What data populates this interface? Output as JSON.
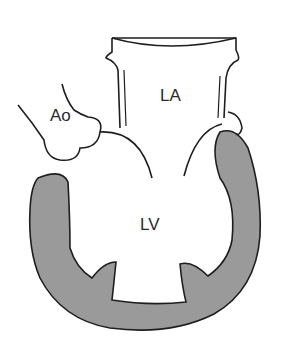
{
  "diagram": {
    "labels": {
      "aorta": "Ao",
      "left_atrium": "LA",
      "left_ventricle": "LV"
    },
    "colors": {
      "myocardium": "#9a9a9a",
      "outline": "#1e1e1e",
      "background": "#ffffff"
    }
  }
}
